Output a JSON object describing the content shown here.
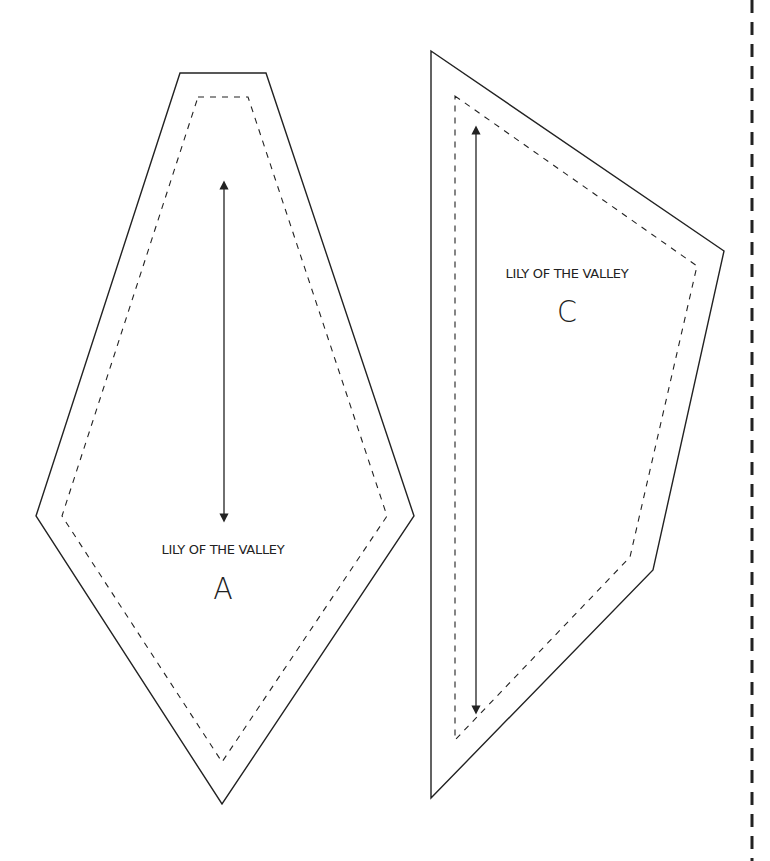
{
  "page": {
    "type": "quilt pattern template sheet",
    "background": "#ffffff",
    "line_color": "#222222",
    "cut_line": {
      "style": "dashed",
      "x": 752,
      "color": "#222222"
    }
  },
  "pieces": [
    {
      "id": "A",
      "name_label": "LILY OF THE VALLEY",
      "letter": "A",
      "shape": "elongated hexagon (kite-like)",
      "outer_points": "180,73 266,73 414,516 222,804 36,516",
      "seam_points": "198,97 248,97 387,516 222,762 62,516",
      "grainline_arrow": {
        "x": 224,
        "y1": 185,
        "y2": 518
      }
    },
    {
      "id": "C",
      "name_label": "LILY OF THE VALLEY",
      "letter": "C",
      "shape": "irregular quadrilateral",
      "outer_points": "431,51 724,251 653,570 431,798",
      "seam_points": "455,96 697,266 630,557 455,740",
      "grainline_arrow": {
        "x": 476,
        "y1": 130,
        "y2": 710
      }
    }
  ]
}
